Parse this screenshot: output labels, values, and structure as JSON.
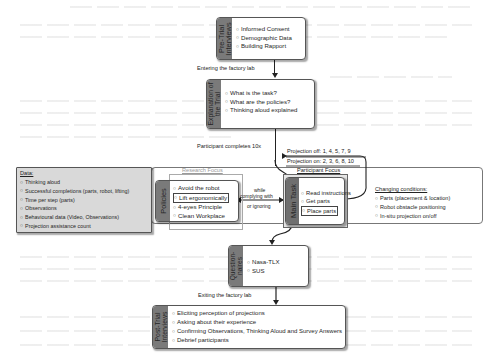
{
  "diagram": {
    "pre_trial": {
      "label": "Pre-Trial Interviews",
      "items": [
        "Informed Consent",
        "Demographic Data",
        "Building Rapport"
      ]
    },
    "transition_enter": "Entering the factory lab",
    "explanation": {
      "label": "Explanation of the Trial",
      "items": [
        "What is the task?",
        "What are the policies?",
        "Thinking aloud explained"
      ]
    },
    "participant_completes": "Participant completes 10x",
    "projection_off": "Projection off: 1, 4, 5, 7, 9",
    "projection_on": "Projection on: 2, 3, 6, 8, 10",
    "data_box": {
      "title": "Data:",
      "items": [
        "Thinking aloud",
        "Successful completions (parts, robot, lifting)",
        "Time per step (parts)",
        "Observations",
        "Behavioural data (Video, Observations)",
        "Projection assistance count"
      ]
    },
    "research_focus": "Research Focus",
    "policies": {
      "label": "Policies",
      "items": [
        "Avoid the robot",
        "Lift ergonomically",
        "4-eyes Principle",
        "Clean Workplace"
      ]
    },
    "relation": {
      "line1": "while",
      "line2": "complying with",
      "line3": "or ignoring"
    },
    "participant_focus": "Participant Focus",
    "main_task": {
      "label": "Main Task",
      "items": [
        "Read instructions",
        "Get parts",
        "Place parts"
      ]
    },
    "changing_conditions": {
      "title": "Changing conditions:",
      "items": [
        "Parts (placement & location)",
        "Robot obstacle positioning",
        "In-situ projection on/off"
      ]
    },
    "questionnaires": {
      "label": "Question-naires",
      "items": [
        "Nasa-TLX",
        "SUS"
      ]
    },
    "transition_exit": "Exiting the factory lab",
    "post_trial": {
      "label": "Post-Trial Interviews",
      "items": [
        "Eliciting perception of projections",
        "Asking about their experience",
        "Confirming Observations, Thinking Aloud and Survey Answers",
        "Debrief participants"
      ]
    }
  },
  "colors": {
    "strip": "#7a7a7a",
    "data_box_bg": "#d9d9d9",
    "border": "#555555",
    "muted_label": "#9a9a9a"
  }
}
